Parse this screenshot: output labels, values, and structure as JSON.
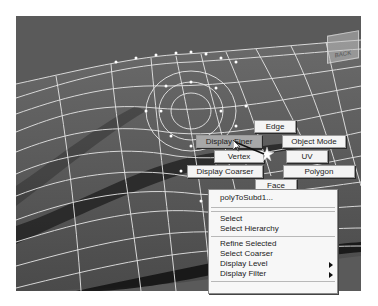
{
  "viewport": {
    "viewcube_label": "BACK",
    "colors": {
      "background": "#5a5a5a",
      "wire": "#e8e8e8",
      "menu_bg": "#f4f4f4",
      "menu_active": "#a8a8a8"
    }
  },
  "marking_menu": {
    "items": [
      {
        "id": "edge",
        "label": "Edge",
        "direction": "north"
      },
      {
        "id": "object-mode",
        "label": "Object Mode",
        "direction": "northeast"
      },
      {
        "id": "uv",
        "label": "UV",
        "direction": "east"
      },
      {
        "id": "polygon",
        "label": "Polygon",
        "direction": "southeast"
      },
      {
        "id": "face",
        "label": "Face",
        "direction": "south"
      },
      {
        "id": "display-coarser",
        "label": "Display Coarser",
        "direction": "southwest"
      },
      {
        "id": "vertex",
        "label": "Vertex",
        "direction": "west"
      },
      {
        "id": "display-finer",
        "label": "Display Finer",
        "direction": "northwest",
        "active": true
      }
    ]
  },
  "context_menu": {
    "title_item": "polyToSubd1...",
    "items": [
      {
        "label": "Select"
      },
      {
        "label": "Select Hierarchy"
      },
      {
        "label": "Refine Selected"
      },
      {
        "label": "Select Coarser"
      },
      {
        "label": "Display Level",
        "submenu": true
      },
      {
        "label": "Display Filter",
        "submenu": true
      }
    ]
  }
}
